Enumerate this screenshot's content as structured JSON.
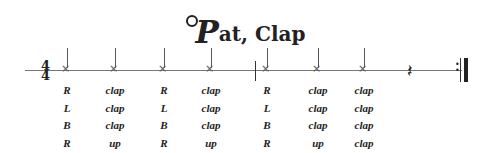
{
  "title": {
    "initial": "P",
    "rest": "at, Clap"
  },
  "time_signature": {
    "top": "4",
    "bottom": "4"
  },
  "notes_x": [
    65,
    113,
    162,
    209,
    265,
    316,
    362
  ],
  "barlines_x": [
    255
  ],
  "columns": [
    {
      "x": 65,
      "rows": [
        "R",
        "L",
        "B",
        "R"
      ]
    },
    {
      "x": 113,
      "rows": [
        "clap",
        "clap",
        "clap",
        "up"
      ]
    },
    {
      "x": 162,
      "rows": [
        "R",
        "L",
        "B",
        "R"
      ]
    },
    {
      "x": 209,
      "rows": [
        "clap",
        "clap",
        "clap",
        "up"
      ]
    },
    {
      "x": 265,
      "rows": [
        "R",
        "L",
        "B",
        "R"
      ]
    },
    {
      "x": 316,
      "rows": [
        "clap",
        "clap",
        "clap",
        "up"
      ]
    },
    {
      "x": 362,
      "rows": [
        "clap",
        "clap",
        "clap",
        "clap"
      ]
    }
  ],
  "symbols": {
    "rest": "quarter-rest",
    "ending": "repeat-end-barline"
  }
}
